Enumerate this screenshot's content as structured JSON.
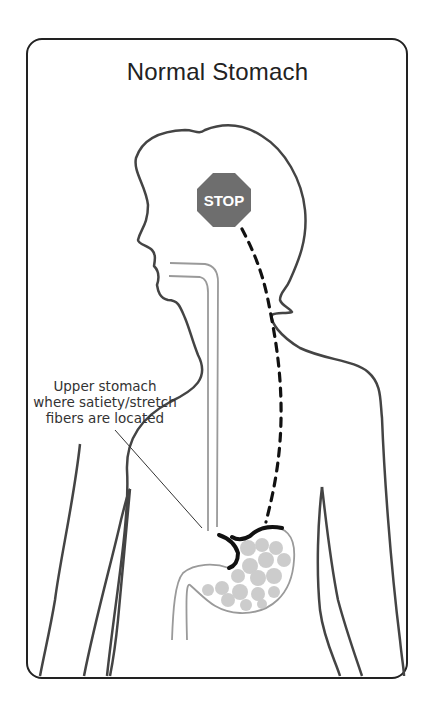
{
  "figure": {
    "title": "Normal Stomach",
    "stop_sign": {
      "text": "STOP",
      "color": "#6e6e6e"
    },
    "annotation": {
      "lines": [
        "Upper stomach",
        "where satiety/stretch",
        "fibers are located"
      ]
    },
    "colors": {
      "outline": "#444444",
      "frame": "#222222",
      "esophagus": "#9a9a9a",
      "satiety_fibers": "#111111",
      "food": "#c4c4c4"
    }
  }
}
